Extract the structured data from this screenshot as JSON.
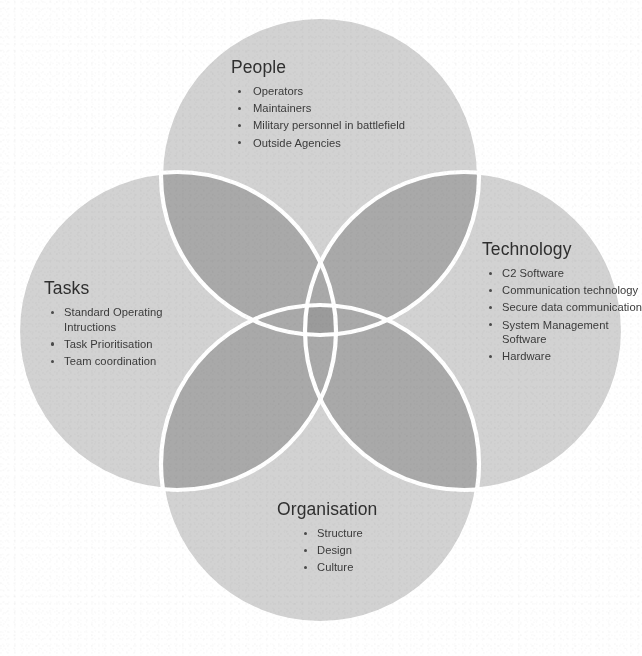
{
  "diagram": {
    "type": "venn",
    "set_count": 4,
    "layout": "four-circle diamond / cross arrangement with pairwise overlaps and a central all-set intersection",
    "colors": {
      "background": "#ffffff",
      "circle_fill": "#d2d2d2",
      "circle_stroke": "#ffffff",
      "pair_overlap": "#a9a9a9",
      "center_overlap": "#9a9a9a",
      "heading_text": "#2f2f2f",
      "body_text": "#3a3a3a",
      "bullet": "#4a4a4a"
    },
    "sets": [
      {
        "id": "people",
        "heading": "People",
        "position": "top",
        "items": [
          "Operators",
          "Maintainers",
          "Military personnel in battlefield",
          "Outside Agencies"
        ]
      },
      {
        "id": "tasks",
        "heading": "Tasks",
        "position": "left",
        "items": [
          "Standard Operating Intructions",
          "Task Prioritisation",
          "Team coordination"
        ]
      },
      {
        "id": "technology",
        "heading": "Technology",
        "position": "right",
        "items": [
          "C2 Software",
          "Communication technology",
          "Secure data communication",
          "System Management Software",
          "Hardware"
        ]
      },
      {
        "id": "organisation",
        "heading": "Organisation",
        "position": "bottom",
        "items": [
          "Structure",
          "Design",
          "Culture"
        ]
      }
    ]
  },
  "caption": {
    "text": ""
  }
}
